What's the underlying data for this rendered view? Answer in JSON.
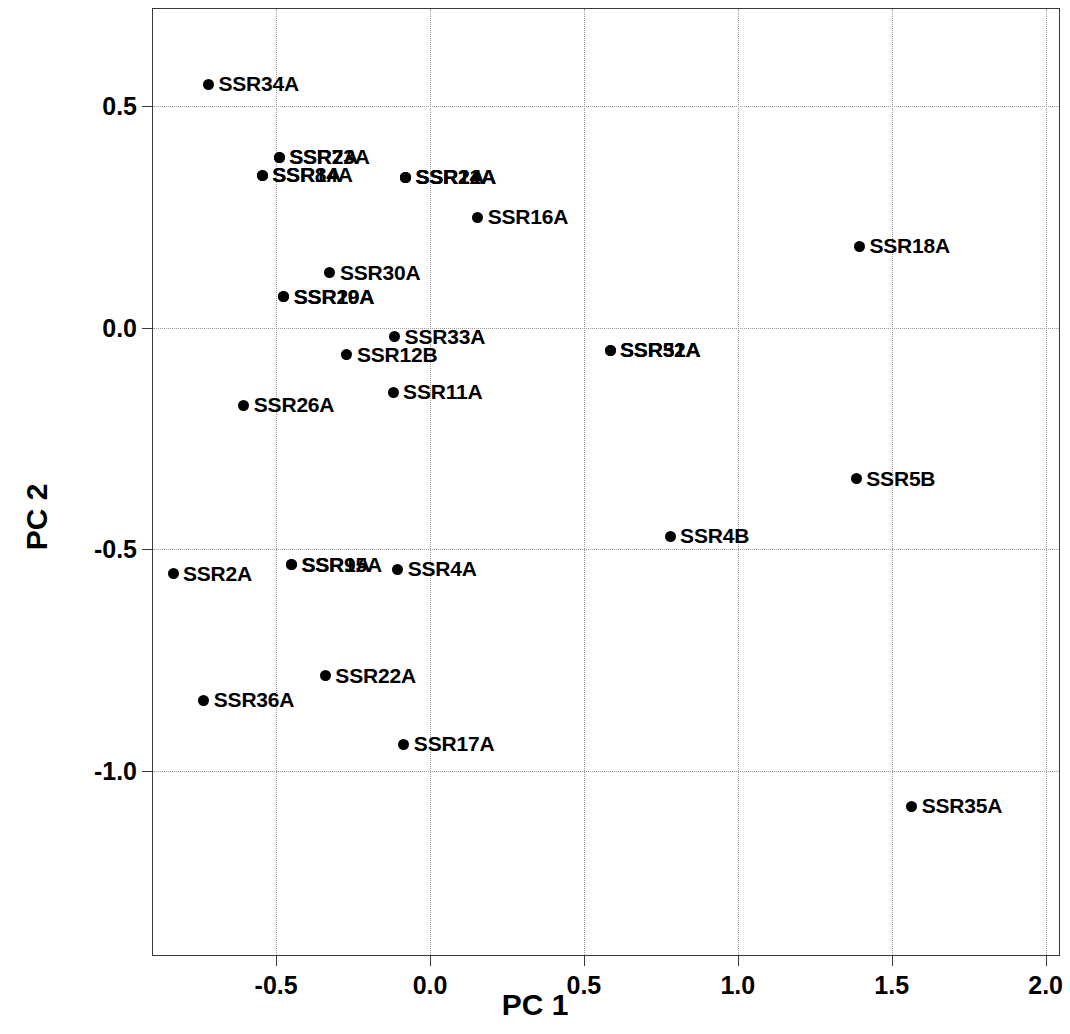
{
  "chart_data": {
    "type": "scatter",
    "title": "",
    "xlabel": "PC 1",
    "ylabel": "PC 2",
    "xlim": [
      -0.9,
      2.05
    ],
    "ylim": [
      -1.42,
      0.72
    ],
    "xticks": [
      "-0.5",
      "0.0",
      "0.5",
      "1.0",
      "1.5",
      "2.0"
    ],
    "xtick_values": [
      -0.5,
      0.0,
      0.5,
      1.0,
      1.5,
      2.0
    ],
    "yticks": [
      "0.5",
      "0.0",
      "-0.5",
      "-1.0"
    ],
    "ytick_values": [
      0.5,
      0.0,
      -0.5,
      -1.0
    ],
    "grid": true,
    "legend": "none",
    "marker_color": "#000000",
    "points": [
      {
        "label": "SSR34A",
        "x": -0.72,
        "y": 0.55
      },
      {
        "label": "SSR7A",
        "x": -0.49,
        "y": 0.385
      },
      {
        "label": "SSR23A",
        "x": -0.49,
        "y": 0.385
      },
      {
        "label": "SSR8A",
        "x": -0.545,
        "y": 0.345
      },
      {
        "label": "SSR14A",
        "x": -0.545,
        "y": 0.345
      },
      {
        "label": "SSR1A",
        "x": -0.08,
        "y": 0.34
      },
      {
        "label": "SSR24A",
        "x": -0.08,
        "y": 0.34
      },
      {
        "label": "SSR21A",
        "x": -0.08,
        "y": 0.34
      },
      {
        "label": "SSR16A",
        "x": 0.155,
        "y": 0.25
      },
      {
        "label": "SSR18A",
        "x": 1.395,
        "y": 0.185
      },
      {
        "label": "SSR30A",
        "x": -0.325,
        "y": 0.125
      },
      {
        "label": "SSR20A",
        "x": -0.475,
        "y": 0.07
      },
      {
        "label": "SSR19A",
        "x": -0.475,
        "y": 0.07
      },
      {
        "label": "SSR33A",
        "x": -0.115,
        "y": -0.02
      },
      {
        "label": "SSR12B",
        "x": -0.27,
        "y": -0.06
      },
      {
        "label": "SSR51A",
        "x": 0.585,
        "y": -0.05
      },
      {
        "label": "SSR32A",
        "x": 0.585,
        "y": -0.05
      },
      {
        "label": "SSR11A",
        "x": -0.12,
        "y": -0.145
      },
      {
        "label": "SSR26A",
        "x": -0.605,
        "y": -0.175
      },
      {
        "label": "SSR5B",
        "x": 1.385,
        "y": -0.34
      },
      {
        "label": "SSR4B",
        "x": 0.78,
        "y": -0.47
      },
      {
        "label": "SSR2A",
        "x": -0.835,
        "y": -0.555
      },
      {
        "label": "SSR9A",
        "x": -0.45,
        "y": -0.535
      },
      {
        "label": "SSR15A",
        "x": -0.45,
        "y": -0.535
      },
      {
        "label": "SSR4A",
        "x": -0.105,
        "y": -0.545
      },
      {
        "label": "SSR22A",
        "x": -0.34,
        "y": -0.785
      },
      {
        "label": "SSR36A",
        "x": -0.735,
        "y": -0.84
      },
      {
        "label": "SSR17A",
        "x": -0.085,
        "y": -0.94
      },
      {
        "label": "SSR35A",
        "x": 1.565,
        "y": -1.08
      }
    ],
    "label_offset_px": 10
  }
}
